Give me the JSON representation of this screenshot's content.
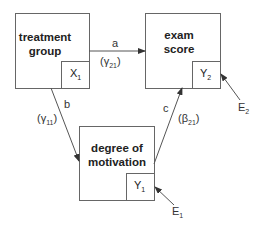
{
  "nodes": {
    "treatment": {
      "title_line1": "treatment",
      "title_line2": "group",
      "var": "X",
      "var_sub": "1"
    },
    "exam": {
      "title_line1": "exam",
      "title_line2": "score",
      "var": "Y",
      "var_sub": "2"
    },
    "motivation": {
      "title_line1": "degree of",
      "title_line2": "motivation",
      "var": "Y",
      "var_sub": "1"
    }
  },
  "paths": {
    "a": {
      "label": "a",
      "coef": "(γ",
      "coef_sub": "21",
      "coef_close": ")"
    },
    "b": {
      "label": "b",
      "coef": "(γ",
      "coef_sub": "11",
      "coef_close": ")"
    },
    "c": {
      "label": "c",
      "coef": "(β",
      "coef_sub": "21",
      "coef_close": ")"
    }
  },
  "errors": {
    "e1": {
      "label": "E",
      "sub": "1"
    },
    "e2": {
      "label": "E",
      "sub": "2"
    }
  },
  "colors": {
    "line": "#555555",
    "text": "#222222",
    "background": "#ffffff"
  }
}
